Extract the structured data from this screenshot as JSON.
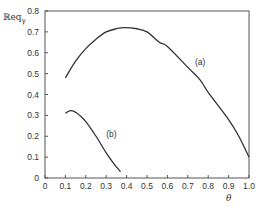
{
  "chart_data": {
    "type": "line",
    "title": "",
    "xlabel": "θ",
    "ylabel": "ℝeq",
    "ylabel_subscript": "γ",
    "xlim": [
      0,
      1.0
    ],
    "ylim": [
      0,
      0.8
    ],
    "grid": false,
    "legend": "inline curve labels",
    "x_ticks": [
      "0",
      "0.1",
      "0.2",
      "0.3",
      "0.4",
      "0.5",
      "0.6",
      "0.7",
      "0.8",
      "0.9",
      "1.0"
    ],
    "y_ticks": [
      "0",
      "0.1",
      "0.2",
      "0.3",
      "0.4",
      "0.5",
      "0.6",
      "0.7",
      "0.8"
    ],
    "series": [
      {
        "name": "(a)",
        "x": [
          0.1,
          0.15,
          0.2,
          0.25,
          0.3,
          0.35,
          0.39,
          0.45,
          0.5,
          0.56,
          0.6,
          0.7,
          0.76,
          0.8,
          0.9,
          0.95,
          1.0
        ],
        "y": [
          0.48,
          0.56,
          0.62,
          0.665,
          0.7,
          0.715,
          0.72,
          0.715,
          0.7,
          0.65,
          0.63,
          0.53,
          0.47,
          0.41,
          0.28,
          0.2,
          0.1
        ],
        "label_pos": [
          0.735,
          0.555
        ]
      },
      {
        "name": "(b)",
        "x": [
          0.1,
          0.12,
          0.14,
          0.17,
          0.2,
          0.25,
          0.3,
          0.34,
          0.37
        ],
        "y": [
          0.31,
          0.322,
          0.32,
          0.3,
          0.27,
          0.2,
          0.12,
          0.065,
          0.03
        ],
        "label_pos": [
          0.3,
          0.21
        ]
      }
    ]
  },
  "labels": {
    "series_a": "(a)",
    "series_b": "(b)",
    "x_axis": "θ",
    "y_axis_main": "ℝeq",
    "y_axis_sub": "γ"
  }
}
